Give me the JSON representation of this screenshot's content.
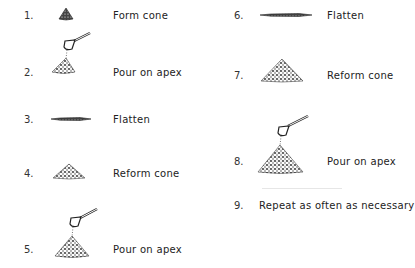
{
  "steps": [
    {
      "number": "1.",
      "label": "Form cone",
      "icon": "small-cone-icon"
    },
    {
      "number": "2.",
      "label": "Pour on apex",
      "icon": "scoop-pour-cone-icon"
    },
    {
      "number": "3.",
      "label": "Flatten",
      "icon": "flattened-pile-icon"
    },
    {
      "number": "4.",
      "label": "Reform cone",
      "icon": "cone-icon"
    },
    {
      "number": "5.",
      "label": "Pour on apex",
      "icon": "scoop-pour-cone-icon"
    },
    {
      "number": "6.",
      "label": "Flatten",
      "icon": "flattened-pile-icon"
    },
    {
      "number": "7.",
      "label": "Reform cone",
      "icon": "cone-icon"
    },
    {
      "number": "8.",
      "label": "Pour on apex",
      "icon": "scoop-pour-cone-icon"
    },
    {
      "number": "9.",
      "label": "Repeat as often as necessary",
      "icon": ""
    }
  ],
  "colors": {
    "ink": "#222222",
    "background": "#ffffff"
  }
}
